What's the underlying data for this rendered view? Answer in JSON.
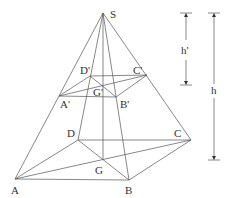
{
  "diagram": {
    "points": {
      "S": {
        "label": "S",
        "x": 103,
        "y": 13
      },
      "A": {
        "label": "A",
        "x": 15,
        "y": 179
      },
      "B": {
        "label": "B",
        "x": 129,
        "y": 180
      },
      "C": {
        "label": "C",
        "x": 191,
        "y": 140
      },
      "D": {
        "label": "D",
        "x": 78,
        "y": 140
      },
      "G": {
        "label": "G",
        "x": 103,
        "y": 160
      },
      "A1": {
        "label": "A'",
        "x": 59,
        "y": 96
      },
      "B1": {
        "label": "B'",
        "x": 116,
        "y": 97
      },
      "C1": {
        "label": "C'",
        "x": 147,
        "y": 75
      },
      "D1": {
        "label": "D'",
        "x": 90,
        "y": 76
      },
      "G1": {
        "label": "G'",
        "x": 103,
        "y": 86
      }
    },
    "dimensions": {
      "h_prime": {
        "label": "h'",
        "x": 186,
        "y_top": 13,
        "y_bottom": 85
      },
      "h": {
        "label": "h",
        "x": 214,
        "y_top": 13,
        "y_bottom": 160
      }
    }
  }
}
